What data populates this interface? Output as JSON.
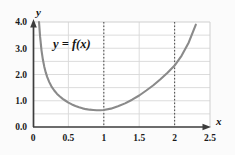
{
  "figure": {
    "background_color": "#fbfbfb",
    "plot_background_color": "#ffffff"
  },
  "annotations": {
    "curve_label": "y = f(x)",
    "x_axis_name": "x",
    "y_axis_name": "y"
  },
  "chart_data": {
    "type": "line",
    "title": "",
    "subtitle": "",
    "xlabel": "x",
    "ylabel": "y",
    "xlim": [
      0,
      2.5
    ],
    "ylim": [
      0,
      4.0
    ],
    "grid": true,
    "grid_color": "#d8d8d8",
    "legend": null,
    "legend_position": "none",
    "x_ticks": [
      0,
      0.5,
      1,
      1.5,
      2,
      2.5
    ],
    "x_tick_labels": [
      "0",
      "0.5",
      "1",
      "1.5",
      "2",
      "2.5"
    ],
    "y_ticks": [
      0.0,
      1.0,
      2.0,
      3.0,
      4.0
    ],
    "y_tick_labels": [
      "0.0",
      "1.0",
      "2.0",
      "3.0",
      "4.0"
    ],
    "x_minor_gridlines": [
      0.5,
      1.0,
      1.5,
      2.0
    ],
    "y_minor_gridlines": [
      0.5,
      1.5,
      2.5,
      3.5
    ],
    "series": [
      {
        "name": "y = f(x)",
        "color": "#8a8a8a",
        "line_width": 2.1,
        "x": [
          0.085,
          0.1,
          0.12,
          0.14,
          0.16,
          0.18,
          0.2,
          0.23,
          0.26,
          0.3,
          0.34,
          0.38,
          0.42,
          0.46,
          0.5,
          0.55,
          0.6,
          0.65,
          0.7,
          0.75,
          0.8,
          0.85,
          0.9,
          0.95,
          1.0,
          1.1,
          1.2,
          1.3,
          1.4,
          1.5,
          1.6,
          1.7,
          1.8,
          1.9,
          2.0,
          2.1,
          2.2,
          2.3
        ],
        "y": [
          4.0,
          3.45,
          2.92,
          2.56,
          2.29,
          2.08,
          1.91,
          1.71,
          1.55,
          1.39,
          1.26,
          1.16,
          1.07,
          1.0,
          0.93,
          0.86,
          0.8,
          0.75,
          0.71,
          0.68,
          0.66,
          0.65,
          0.64,
          0.64,
          0.65,
          0.7,
          0.79,
          0.9,
          1.04,
          1.2,
          1.39,
          1.59,
          1.82,
          2.07,
          2.34,
          2.72,
          3.22,
          3.9
        ]
      }
    ],
    "vertical_marker_lines": [
      {
        "x": 1,
        "style": "dotted",
        "color": "#555555"
      },
      {
        "x": 2,
        "style": "dotted",
        "color": "#555555"
      }
    ],
    "annotations": [
      {
        "text": "y = f(x)",
        "x": 0.3,
        "y": 3.28
      }
    ]
  }
}
